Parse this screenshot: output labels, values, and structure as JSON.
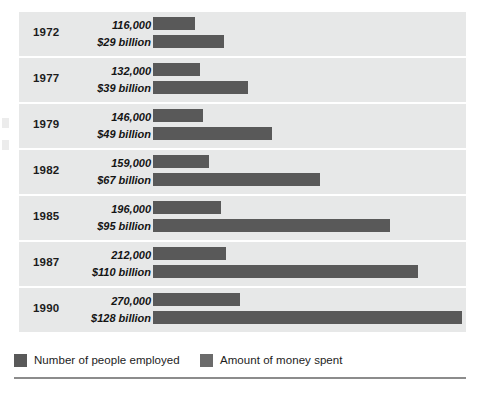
{
  "chart_data": {
    "type": "bar",
    "title": "",
    "subtitle": "",
    "xlabel": "",
    "ylabel": "",
    "orientation": "horizontal",
    "grid": false,
    "legend_position": "bottom-left",
    "categories": [
      "1972",
      "1977",
      "1979",
      "1982",
      "1985",
      "1987",
      "1990"
    ],
    "series": [
      {
        "name": "Number of people employed",
        "unit": "people",
        "color": "#595959",
        "values": [
          116000,
          132000,
          146000,
          159000,
          196000,
          212000,
          270000
        ],
        "labels": [
          "116,000",
          "132,000",
          "146,000",
          "159,000",
          "196,000",
          "212,000",
          "270,000"
        ],
        "max": 270000
      },
      {
        "name": "Amount of money spent",
        "unit": "billion USD",
        "color": "#595959",
        "values": [
          29,
          39,
          49,
          67,
          95,
          110,
          128
        ],
        "labels": [
          "$29 billion",
          "$39 billion",
          "$49 billion",
          "$67 billion",
          "$95 billion",
          "$110 billion",
          "$128 billion"
        ],
        "max": 128
      }
    ]
  },
  "rows": [
    {
      "year": "1972",
      "employed_label": "116,000",
      "money_label": "$29 billion",
      "employed_width": 42,
      "money_width": 71
    },
    {
      "year": "1977",
      "employed_label": "132,000",
      "money_label": "$39 billion",
      "employed_width": 47,
      "money_width": 95
    },
    {
      "year": "1979",
      "employed_label": "146,000",
      "money_label": "$49 billion",
      "employed_width": 50,
      "money_width": 119
    },
    {
      "year": "1982",
      "employed_label": "159,000",
      "money_label": "$67 billion",
      "employed_width": 56,
      "money_width": 167
    },
    {
      "year": "1985",
      "employed_label": "196,000",
      "money_label": "$95 billion",
      "employed_width": 68,
      "money_width": 237
    },
    {
      "year": "1987",
      "employed_label": "212,000",
      "money_label": "$110 billion",
      "employed_width": 73,
      "money_width": 265
    },
    {
      "year": "1990",
      "employed_label": "270,000",
      "money_label": "$128 billion",
      "employed_width": 87,
      "money_width": 309
    }
  ],
  "legend": {
    "items": [
      {
        "label": "Number of people employed",
        "color": "#595959"
      },
      {
        "label": "Amount of money spent",
        "color": "#6b6b6b"
      }
    ]
  },
  "colors": {
    "bar": "#595959",
    "band": "#e7e8e8",
    "rule": "#8c8c8c",
    "page": "#ffffff"
  }
}
